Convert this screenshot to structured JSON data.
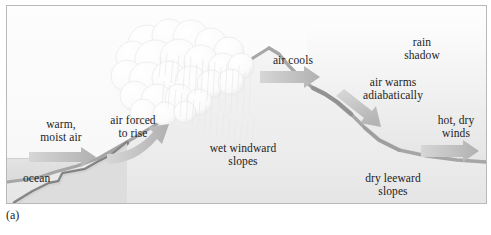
{
  "figure": {
    "caption": "(a)"
  },
  "colors": {
    "frame": "#b9b9b9",
    "sky": "#fbfbfb",
    "ocean": "#dadada",
    "mountain_fill": "#f0f0f0",
    "ridge_line": "#a8a8a8",
    "seafloor": "#8f8f8f",
    "arrow": "#bdbdbd",
    "cloud": "#fdfdfd",
    "text": "#1c1c1c"
  },
  "labels": {
    "warm_moist_air": "warm,\nmoist air",
    "warm_moist_air_line1": "warm,",
    "warm_moist_air_line2": "moist air",
    "ocean": "ocean",
    "air_forced_to_rise_line1": "air forced",
    "air_forced_to_rise_line2": "to rise",
    "wet_windward_line1": "wet windward",
    "wet_windward_line2": "slopes",
    "air_cools": "air cools",
    "rain_shadow_line1": "rain",
    "rain_shadow_line2": "shadow",
    "air_warms_line1": "air warms",
    "air_warms_line2": "adiabatically",
    "hot_dry_winds_line1": "hot, dry",
    "hot_dry_winds_line2": "winds",
    "dry_leeward_line1": "dry leeward",
    "dry_leeward_line2": "slopes"
  },
  "arrows": {
    "warm_moist_air": "horizontal-right-arrow",
    "air_forced_to_rise": "curved-up-right-arrow",
    "air_cools": "horizontal-right-arrow",
    "air_warms": "diagonal-down-right-arrow",
    "hot_dry_winds": "horizontal-right-arrow"
  },
  "features": {
    "cloud": "cumulus-cloud",
    "precipitation": "rain-streaks",
    "mountain": "mountain-profile",
    "ocean": "ocean-band",
    "rain_shadow": "haze-wash"
  }
}
